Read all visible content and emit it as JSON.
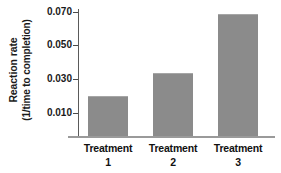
{
  "chart_data": {
    "type": "bar",
    "title": "",
    "subtitle": "",
    "xlabel": "",
    "ylabel_line1": "Reaction rate",
    "ylabel_line2": "(1/time to completion)",
    "categories": [
      "Treatment 1",
      "Treatment 2",
      "Treatment 3"
    ],
    "category_names": [
      "Treatment",
      "Treatment",
      "Treatment"
    ],
    "category_numbers": [
      "1",
      "2",
      "3"
    ],
    "values": [
      0.02,
      0.0335,
      0.069
    ],
    "ytick_labels": [
      "0.010",
      "0.030",
      "0.050",
      "0.070"
    ],
    "ytick_values": [
      0.01,
      0.03,
      0.05,
      0.07
    ],
    "ylim": [
      0.0034,
      0.0745
    ],
    "grid": false,
    "legend": false,
    "legend_position": "none",
    "bar_color": "#8b8b8b",
    "axis_color": "#5a5a5a",
    "baseline_color": "#9a9a9a",
    "background_color": "#ffffff",
    "text_color": "#111111",
    "note": "Axis baseline is truncated; bars do not start at zero."
  }
}
